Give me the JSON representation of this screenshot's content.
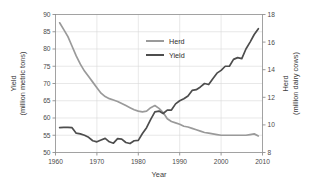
{
  "chart_data": {
    "type": "line",
    "title": "",
    "xlabel": "Year",
    "ylabel": "Yield\n(million metric tons)",
    "y2label": "Herd\n(million dairy cows)",
    "xlim": [
      1960,
      2010
    ],
    "ylim": [
      50,
      90
    ],
    "y2lim": [
      8,
      18
    ],
    "xticks": [
      "1960",
      "1970",
      "1980",
      "1990",
      "2000",
      "2010"
    ],
    "xtick_values": [
      1960,
      1970,
      1980,
      1990,
      2000,
      2010
    ],
    "yticks": [
      "50",
      "55",
      "60",
      "65",
      "70",
      "75",
      "80",
      "85",
      "90"
    ],
    "ytick_values": [
      50,
      55,
      60,
      65,
      70,
      75,
      80,
      85,
      90
    ],
    "y2ticks": [
      "8",
      "10",
      "12",
      "14",
      "16",
      "18"
    ],
    "y2tick_values": [
      8,
      10,
      12,
      14,
      16,
      18
    ],
    "grid": true,
    "legend_position": "upper-center",
    "x": [
      1961,
      1962,
      1963,
      1964,
      1965,
      1966,
      1967,
      1968,
      1969,
      1970,
      1971,
      1972,
      1973,
      1974,
      1975,
      1976,
      1977,
      1978,
      1979,
      1980,
      1981,
      1982,
      1983,
      1984,
      1985,
      1986,
      1987,
      1988,
      1989,
      1990,
      1991,
      1992,
      1993,
      1994,
      1995,
      1996,
      1997,
      1998,
      1999,
      2000,
      2001,
      2002,
      2003,
      2004,
      2005,
      2006,
      2007,
      2008,
      2009
    ],
    "series": [
      {
        "name": "Herd",
        "axis": "right",
        "unit": "million dairy cows",
        "color": "#9a9a9a",
        "values": [
          17.4,
          16.9,
          16.4,
          15.7,
          15.0,
          14.4,
          13.9,
          13.5,
          13.1,
          12.7,
          12.3,
          12.05,
          11.9,
          11.8,
          11.7,
          11.55,
          11.4,
          11.25,
          11.1,
          11.0,
          10.95,
          11.0,
          11.25,
          11.4,
          11.2,
          10.9,
          10.45,
          10.25,
          10.15,
          10.05,
          9.9,
          9.85,
          9.75,
          9.65,
          9.55,
          9.45,
          9.4,
          9.35,
          9.3,
          9.25,
          9.25,
          9.25,
          9.25,
          9.25,
          9.25,
          9.25,
          9.3,
          9.35,
          9.2
        ],
        "values_left_axis_equivalent": [
          87.0,
          85.0,
          83.0,
          80.0,
          77.0,
          74.0,
          71.5,
          70.0,
          68.0,
          66.0,
          64.0,
          63.0,
          62.4,
          62.0,
          61.6,
          61.0,
          60.4,
          60.0,
          59.5,
          59.0,
          58.7,
          59.0,
          60.0,
          60.6,
          59.8,
          58.6,
          57.0,
          56.2,
          55.8,
          55.4,
          54.8,
          54.6,
          54.2,
          53.8,
          53.4,
          53.0,
          52.8,
          52.6,
          52.4,
          52.2,
          52.2,
          52.2,
          52.2,
          52.2,
          52.2,
          52.2,
          52.4,
          52.6,
          51.9
        ]
      },
      {
        "name": "Yield",
        "axis": "left",
        "unit": "million metric tons",
        "color": "#4d4d4d",
        "values": [
          57.2,
          57.3,
          57.3,
          57.2,
          55.6,
          55.4,
          55.0,
          54.4,
          53.4,
          53.1,
          53.6,
          54.1,
          53.1,
          52.7,
          54.0,
          53.9,
          52.9,
          52.6,
          53.4,
          53.5,
          55.5,
          57.2,
          59.6,
          61.8,
          62.0,
          61.3,
          62.3,
          62.3,
          64.1,
          65.0,
          65.6,
          66.4,
          68.0,
          68.2,
          69.0,
          70.0,
          69.7,
          71.4,
          73.0,
          73.8,
          75.0,
          75.0,
          77.0,
          77.5,
          77.2,
          80.0,
          82.0,
          84.2,
          85.9
        ]
      }
    ],
    "legend": [
      {
        "label": "Herd",
        "color": "#9a9a9a"
      },
      {
        "label": "Yield",
        "color": "#4d4d4d"
      }
    ]
  },
  "axes": {
    "left_title_line1": "Yield",
    "left_title_line2": "(million metric tons)",
    "right_title_line1": "Herd",
    "right_title_line2": "(million dairy cows)",
    "x_title": "Year"
  },
  "colors": {
    "herd": "#9a9a9a",
    "yield": "#4d4d4d",
    "grid": "#d9d9d9",
    "frame": "#8c8c8c",
    "background": "#ffffff"
  }
}
